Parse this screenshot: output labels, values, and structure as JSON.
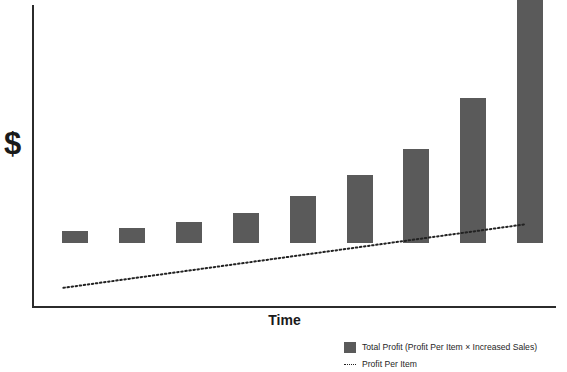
{
  "chart_data": {
    "type": "bar",
    "title": "",
    "subtitle": "",
    "xlabel": "Time",
    "ylabel": "$",
    "grid": false,
    "legend_position": "bottom-right",
    "categories": [
      "1",
      "2",
      "3",
      "4",
      "5",
      "6",
      "7",
      "8",
      "9"
    ],
    "axis_ranges": {
      "ylim": [
        0,
        100
      ],
      "xlim": [
        0,
        10
      ]
    },
    "series": [
      {
        "name": "Total Profit (Profit Per Item × Increased Sales)",
        "type": "bar",
        "color": "#5a5a5a",
        "values": [
          4,
          5,
          7,
          10,
          16,
          23,
          32,
          49,
          98
        ]
      },
      {
        "name": "Profit Per Item",
        "type": "line",
        "style": "dotted",
        "color": "#222222",
        "x": [
          0.6,
          9.4
        ],
        "values": [
          6.5,
          28
        ]
      }
    ],
    "annotations": []
  },
  "axes": {
    "y_title": "$",
    "x_title": "Time"
  },
  "legend": {
    "items": [
      {
        "marker": "filled-square",
        "color": "#5a5a5a",
        "label": "Total Profit (Profit Per Item × Increased Sales)"
      },
      {
        "marker": "dotted-line",
        "color": "#222222",
        "label": "Profit Per Item"
      }
    ]
  }
}
